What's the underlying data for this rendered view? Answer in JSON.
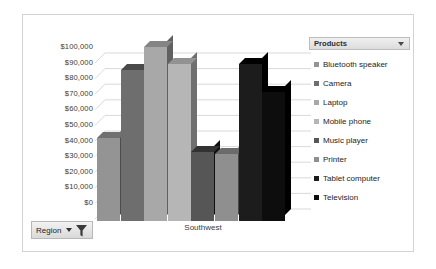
{
  "chart_data": {
    "type": "bar",
    "title": "",
    "subtitle": "",
    "xlabel": "Southwest",
    "ylabel": "",
    "categories": [
      "Southwest"
    ],
    "grid": true,
    "legend_position": "right",
    "ylim": [
      0,
      100000
    ],
    "ytick_step": 10000,
    "ytick_labels": [
      "$100,000",
      "$90,000",
      "$80,000",
      "$70,000",
      "$60,000",
      "$50,000",
      "$40,000",
      "$30,000",
      "$20,000",
      "$10,000",
      "$0"
    ],
    "ytick_values": [
      100000,
      90000,
      80000,
      70000,
      60000,
      50000,
      40000,
      30000,
      20000,
      10000,
      0
    ],
    "series": [
      {
        "name": "Bluetooth speaker",
        "values": [
          48000
        ],
        "color": "#949494"
      },
      {
        "name": "Camera",
        "values": [
          88000
        ],
        "color": "#6e6e6e"
      },
      {
        "name": "Laptop",
        "values": [
          101000
        ],
        "color": "#a8a8a8"
      },
      {
        "name": "Mobile phone",
        "values": [
          91000
        ],
        "color": "#b6b6b6"
      },
      {
        "name": "Music player",
        "values": [
          40000
        ],
        "color": "#565656"
      },
      {
        "name": "Printer",
        "values": [
          39000
        ],
        "color": "#8f8f8f"
      },
      {
        "name": "Tablet computer",
        "values": [
          91000
        ],
        "color": "#1c1c1c"
      },
      {
        "name": "Television",
        "values": [
          75000
        ],
        "color": "#0d0d0d"
      }
    ]
  },
  "products_slicer": {
    "header_label": "Products",
    "caret_icon": "chevron-down-icon",
    "items": [
      {
        "label": "Bluetooth speaker",
        "swatch": "#949494"
      },
      {
        "label": "Camera",
        "swatch": "#6e6e6e"
      },
      {
        "label": "Laptop",
        "swatch": "#a8a8a8"
      },
      {
        "label": "Mobile phone",
        "swatch": "#b6b6b6"
      },
      {
        "label": "Music player",
        "swatch": "#565656"
      },
      {
        "label": "Printer",
        "swatch": "#8f8f8f"
      },
      {
        "label": "Tablet computer",
        "swatch": "#1c1c1c"
      },
      {
        "label": "Television",
        "swatch": "#0d0d0d"
      }
    ]
  },
  "region_slicer": {
    "label": "Region",
    "caret_icon": "chevron-down-icon",
    "filter_icon": "funnel-icon"
  }
}
